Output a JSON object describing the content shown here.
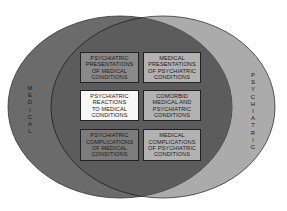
{
  "diagram": {
    "type": "venn",
    "sets": [
      {
        "id": "medical",
        "label": "MEDICAL",
        "color": "#6b6b6b"
      },
      {
        "id": "psychiatric",
        "label": "PSYCHIATRIC",
        "color": "#ababab"
      }
    ],
    "intersection_color": "#5c5c5c",
    "boxes": [
      {
        "lines": [
          "PSYCHIATRIC",
          "PRESENTATIONS",
          "OF MEDICAL",
          "CONDITIONS"
        ],
        "fill": "#8a8a8a"
      },
      {
        "lines": [
          "MEDICAL",
          "PRESENTATIONS",
          "OF PSYCHIATRIC",
          "CONDITIONS"
        ],
        "fill": "#b2b2b2"
      },
      {
        "lines": [
          "PSYCHIATRIC",
          "REACTIONS",
          "TO MEDICAL",
          "CONDITIONS"
        ],
        "fill": "#f7f7f7"
      },
      {
        "lines": [
          "COMORBID",
          "MEDICAL AND",
          "PSYCHIATRIC",
          "CONDITIONS"
        ],
        "fill": "#b2b2b2"
      },
      {
        "lines": [
          "PSYCHIATRIC",
          "COMPLICATIONS",
          "OF MEDICAL",
          "CONDITIONS"
        ],
        "fill": "#7c7c7c"
      },
      {
        "lines": [
          "MEDICAL",
          "COMPLICATIONS",
          "OF PSYCHIATRIC",
          "CONDITIONS"
        ],
        "fill": "#b2b2b2"
      }
    ],
    "left_label_letters": [
      "M",
      "E",
      "D",
      "I",
      "C",
      "A",
      "L"
    ],
    "right_label_letters": [
      "P",
      "S",
      "Y",
      "C",
      "H",
      "I",
      "A",
      "T",
      "R",
      "I",
      "C"
    ]
  }
}
